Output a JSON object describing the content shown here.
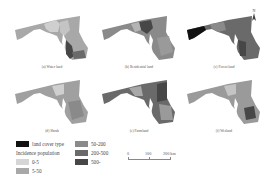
{
  "figure": {
    "panels": [
      {
        "id": "a",
        "caption": "(a) Water land",
        "left": 8,
        "top": 12,
        "tone": "light"
      },
      {
        "id": "b",
        "caption": "(b) Residential land",
        "left": 95,
        "top": 12,
        "tone": "mid"
      },
      {
        "id": "c",
        "caption": "(c) Forest land",
        "left": 180,
        "top": 12,
        "tone": "dark"
      },
      {
        "id": "d",
        "caption": "(d) Shrub",
        "left": 8,
        "top": 76,
        "tone": "light"
      },
      {
        "id": "e",
        "caption": "(e) Farmland",
        "left": 95,
        "top": 76,
        "tone": "dark"
      },
      {
        "id": "f",
        "caption": "(f) Wetland",
        "left": 180,
        "top": 76,
        "tone": "mid"
      }
    ],
    "north_arrow": {
      "label": "N"
    },
    "legend": {
      "land_cover_label": "land cover type",
      "incidence_label": "Incidence population",
      "items": [
        {
          "label": "0-5",
          "color": "#d6d6d6"
        },
        {
          "label": "5-50",
          "color": "#a8a8a8"
        },
        {
          "label": "50-200",
          "color": "#8a8a8a"
        },
        {
          "label": "200-500",
          "color": "#6a6a6a"
        },
        {
          "label": "500-",
          "color": "#474747"
        }
      ],
      "land_cover_color": "#111111"
    },
    "scale_bar": {
      "ticks": [
        "0",
        "100",
        "200 km"
      ]
    }
  }
}
